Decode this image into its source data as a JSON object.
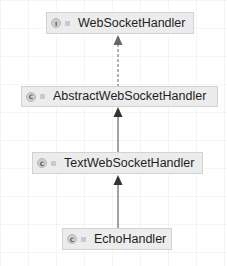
{
  "diagram": {
    "type": "class-hierarchy",
    "nodes": [
      {
        "id": "n1",
        "label": "WebSocketHandler",
        "kind": "interface",
        "badge": "I"
      },
      {
        "id": "n2",
        "label": "AbstractWebSocketHandler",
        "kind": "class",
        "badge": "C"
      },
      {
        "id": "n3",
        "label": "TextWebSocketHandler",
        "kind": "class",
        "badge": "C"
      },
      {
        "id": "n4",
        "label": "EchoHandler",
        "kind": "class",
        "badge": "C"
      }
    ],
    "edges": [
      {
        "from": "AbstractWebSocketHandler",
        "to": "WebSocketHandler",
        "style": "dashed",
        "relation": "implements"
      },
      {
        "from": "TextWebSocketHandler",
        "to": "AbstractWebSocketHandler",
        "style": "solid",
        "relation": "extends"
      },
      {
        "from": "EchoHandler",
        "to": "TextWebSocketHandler",
        "style": "solid",
        "relation": "extends"
      }
    ],
    "colors": {
      "node_fill": "#ececec",
      "node_border": "#d2d2d2",
      "edge": "#444444",
      "background": "#ffffff"
    }
  }
}
